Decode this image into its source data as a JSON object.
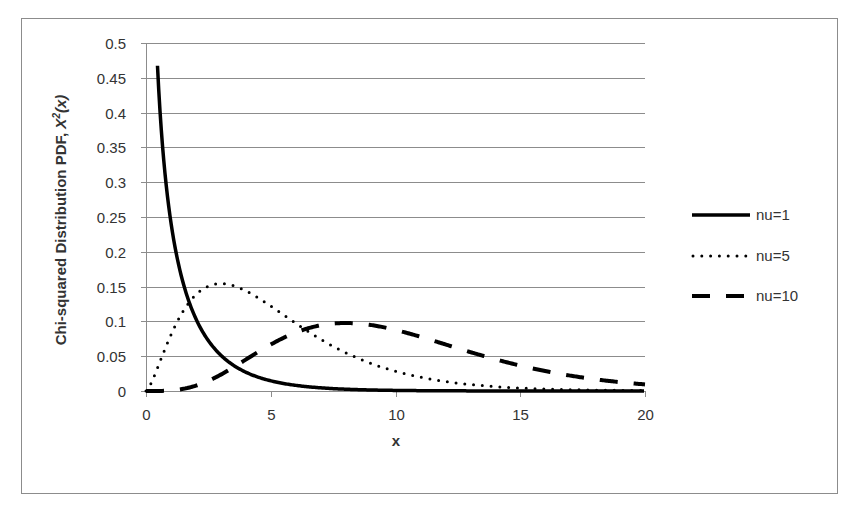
{
  "chart_data": {
    "type": "line",
    "title": "",
    "xlabel": "x",
    "ylabel": "Chi-squared Distribution PDF, X²(x)",
    "ylabel_plain": "Chi-squared Distribution PDF, ",
    "ylabel_italic_base": "X",
    "ylabel_italic_sup": "2",
    "ylabel_italic_tail": "(x)",
    "xlim": [
      0,
      20
    ],
    "ylim": [
      0,
      0.5
    ],
    "x_ticks": [
      "0",
      "5",
      "10",
      "15",
      "20"
    ],
    "y_ticks": [
      "0",
      "0.05",
      "0.1",
      "0.15",
      "0.2",
      "0.25",
      "0.3",
      "0.35",
      "0.4",
      "0.45",
      "0.5"
    ],
    "grid": {
      "horizontal": true,
      "vertical": false
    },
    "legend_position": "right",
    "series": [
      {
        "name": "nu=1",
        "dof": 1,
        "style": "solid",
        "x": [
          0.5,
          1,
          2,
          3,
          4,
          5,
          6,
          8,
          10,
          15,
          20
        ],
        "values": [
          0.439,
          0.242,
          0.104,
          0.051,
          0.027,
          0.015,
          0.008,
          0.003,
          0.001,
          0.0,
          0.0
        ]
      },
      {
        "name": "nu=5",
        "dof": 5,
        "style": "dotted",
        "x": [
          0,
          1,
          2,
          3,
          4,
          5,
          6,
          8,
          10,
          12,
          15,
          20
        ],
        "values": [
          0.0,
          0.081,
          0.138,
          0.154,
          0.144,
          0.122,
          0.097,
          0.055,
          0.028,
          0.013,
          0.004,
          0.0
        ]
      },
      {
        "name": "nu=10",
        "dof": 10,
        "style": "dashed",
        "x": [
          0,
          2,
          4,
          6,
          8,
          10,
          12,
          14,
          16,
          18,
          20
        ],
        "values": [
          0.0,
          0.008,
          0.045,
          0.084,
          0.098,
          0.088,
          0.067,
          0.046,
          0.028,
          0.017,
          0.009
        ]
      }
    ]
  },
  "legend": {
    "items": [
      {
        "label": "nu=1",
        "style": "solid"
      },
      {
        "label": "nu=5",
        "style": "dotted"
      },
      {
        "label": "nu=10",
        "style": "dashed"
      }
    ]
  },
  "colors": {
    "line": "#000000",
    "grid": "#8c8c8c",
    "frame": "#8c8c8c",
    "text": "#333333",
    "background": "#ffffff"
  }
}
